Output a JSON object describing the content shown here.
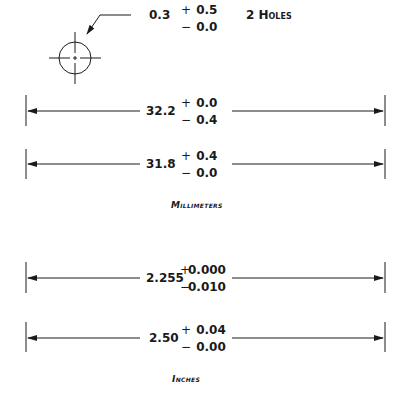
{
  "hole_callout": {
    "nominal": "0.3",
    "plus_sign": "+",
    "plus_tol": "0.5",
    "minus_sign": "−",
    "minus_tol": "0.0",
    "note": "2 Holes"
  },
  "millimeters": {
    "caption": "Millimeters",
    "dims": [
      {
        "nominal": "32.2",
        "plus_sign": "+",
        "plus_tol": "0.0",
        "minus_sign": "−",
        "minus_tol": "0.4"
      },
      {
        "nominal": "31.8",
        "plus_sign": "+",
        "plus_tol": "0.4",
        "minus_sign": "−",
        "minus_tol": "0.0"
      }
    ]
  },
  "inches": {
    "caption": "Inches",
    "dims": [
      {
        "nominal": "2.255",
        "plus_sign": "+",
        "plus_tol": "0.000",
        "minus_sign": "−",
        "minus_tol": "0.010"
      },
      {
        "nominal": "2.50",
        "plus_sign": "+",
        "plus_tol": "0.04",
        "minus_sign": "−",
        "minus_tol": "0.00"
      }
    ]
  }
}
